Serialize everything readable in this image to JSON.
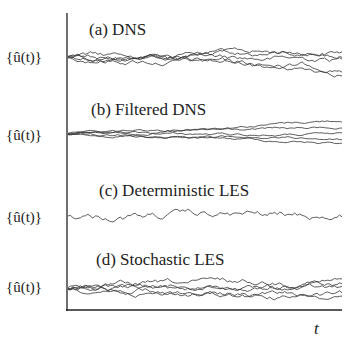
{
  "chart_data": {
    "type": "line",
    "title": "",
    "xlabel": "t",
    "ylabel": "{û(t)}",
    "panels": [
      {
        "label": "(a) DNS",
        "ylabel": "{û(t)}",
        "n_traces": 5,
        "description": "five diverging trajectories, moderate spread"
      },
      {
        "label": "(b) Filtered DNS",
        "ylabel": "{û(t)}",
        "n_traces": 5,
        "description": "five trajectories starting nearly identical, slowly diverging"
      },
      {
        "label": "(c) Deterministic LES",
        "ylabel": "{û(t)}",
        "n_traces": 1,
        "description": "single trajectory"
      },
      {
        "label": "(d) Stochastic LES",
        "ylabel": "{û(t)}",
        "n_traces": 5,
        "description": "five diverging trajectories, moderate spread"
      }
    ],
    "grid": false,
    "legend": "none"
  }
}
